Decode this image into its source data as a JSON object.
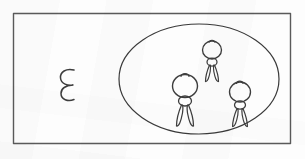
{
  "scene": {
    "title": "Hand-drawn sketch: three figures inside an oval enclosure, one figure outside",
    "medium": "pencil-on-paper scan",
    "canvas": {
      "width": 305,
      "height": 159
    },
    "background_color": "#fdfdfd",
    "ink_color": "#3a3a3a",
    "frame_color": "#5a5a5a"
  },
  "frame": {
    "label": "outer-rectangle",
    "x": 13,
    "y": 13,
    "width": 277,
    "height": 130,
    "stroke_width": 1.4
  },
  "enclosure": {
    "label": "oval-enclosure",
    "center_x": 199,
    "center_y": 79,
    "radius_x": 80,
    "radius_y": 55,
    "stroke_width": 1.2
  },
  "outside_mark": {
    "label": "lone-squiggle-figure",
    "glyph_name": "reversed-three-squiggle",
    "x": 66,
    "y": 82,
    "scale": 1.0
  },
  "figures": [
    {
      "id": "figure-center",
      "label": "stick-figure-center",
      "inside_enclosure": true,
      "head_cx": 185,
      "head_cy": 86,
      "head_rx": 12,
      "head_ry": 11,
      "tuft": true,
      "body_cx": 185,
      "body_cy": 101,
      "body_rx": 6,
      "body_ry": 5,
      "leg_length": 22,
      "scale": 1.0
    },
    {
      "id": "figure-upper",
      "label": "stick-figure-upper",
      "inside_enclosure": true,
      "head_cx": 212,
      "head_cy": 50,
      "head_rx": 9,
      "head_ry": 9,
      "tuft": true,
      "body_cx": 212,
      "body_cy": 62,
      "body_rx": 5,
      "body_ry": 4,
      "leg_length": 17,
      "scale": 0.82
    },
    {
      "id": "figure-right",
      "label": "stick-figure-right",
      "inside_enclosure": true,
      "head_cx": 240,
      "head_cy": 92,
      "head_rx": 10,
      "head_ry": 10,
      "tuft": true,
      "body_cx": 240,
      "body_cy": 105,
      "body_rx": 5,
      "body_ry": 4,
      "leg_length": 19,
      "scale": 0.9
    }
  ],
  "counts": {
    "figures_inside": 3,
    "figures_outside": 1,
    "total_figures": 4
  }
}
